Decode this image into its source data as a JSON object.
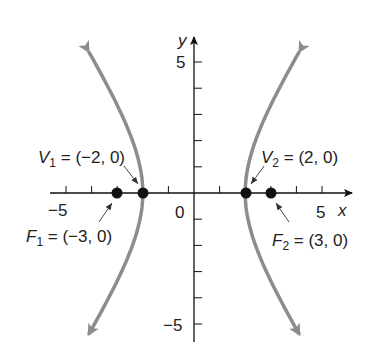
{
  "chart_data": {
    "type": "line",
    "title": "",
    "xlabel": "x",
    "ylabel": "y",
    "xlim": [
      -5,
      5
    ],
    "ylim": [
      -5,
      5
    ],
    "x_tick_labels": [
      "-5",
      "0",
      "5"
    ],
    "y_tick_labels": [
      "5",
      "-5"
    ],
    "x_ticks": [
      -5,
      -4,
      -3,
      -2,
      -1,
      1,
      2,
      3,
      4,
      5
    ],
    "y_ticks": [
      -5,
      -4,
      -3,
      -2,
      -1,
      1,
      2,
      3,
      4,
      5
    ],
    "grid": false,
    "curve_color": "#8c8c8c",
    "series": [
      {
        "name": "left branch",
        "a": 2,
        "b2": 5,
        "branch": "left"
      },
      {
        "name": "right branch",
        "a": 2,
        "b2": 5,
        "branch": "right"
      }
    ],
    "points": [
      {
        "name": "V1",
        "x": -2,
        "y": 0,
        "label": "V1 = (−2, 0)"
      },
      {
        "name": "V2",
        "x": 2,
        "y": 0,
        "label": "V2 = (2, 0)"
      },
      {
        "name": "F1",
        "x": -3,
        "y": 0,
        "label": "F1 = (−3, 0)"
      },
      {
        "name": "F2",
        "x": 3,
        "y": 0,
        "label": "F2 = (3, 0)"
      }
    ]
  },
  "labels": {
    "x_axis": "x",
    "y_axis": "y",
    "tick_neg5_x": "−5",
    "tick_0": "0",
    "tick_5_x": "5",
    "tick_5_y": "5",
    "tick_neg5_y": "−5",
    "v1_letter": "V",
    "v1_sub": "1",
    "v1_rest": " = (−2, 0)",
    "v2_letter": "V",
    "v2_sub": "2",
    "v2_rest": " = (2, 0)",
    "f1_letter": "F",
    "f1_sub": "1",
    "f1_rest": " = (−3, 0)",
    "f2_letter": "F",
    "f2_sub": "2",
    "f2_rest": " = (3, 0)"
  }
}
